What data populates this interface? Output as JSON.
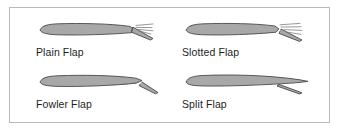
{
  "figure": {
    "border_color": "#b9b9b9",
    "background_color": "#ffffff",
    "airfoil_fill": "#a8a8a8",
    "airfoil_stroke": "#4a4a4a",
    "label_color": "#1e1e1e"
  },
  "panels": [
    {
      "id": "plain-flap",
      "label": "Plain Flap",
      "description": "Airfoil cross-section with hinged trailing edge deflected downward, airflow lines trailing aft",
      "has_slot": false,
      "has_airflow_lines": true
    },
    {
      "id": "slotted-flap",
      "label": "Slotted Flap",
      "description": "Airfoil cross-section with flap deflected downward and a slot between wing and flap, airflow lines trailing aft",
      "has_slot": true,
      "has_airflow_lines": true
    },
    {
      "id": "fowler-flap",
      "label": "Fowler Flap",
      "description": "Airfoil cross-section with flap extended rearward and downward along a track, slot visible",
      "has_slot": true,
      "has_airflow_lines": false
    },
    {
      "id": "split-flap",
      "label": "Split Flap",
      "description": "Airfoil cross-section with lower surface of trailing edge deflected downward, upper surface unchanged",
      "has_slot": false,
      "has_airflow_lines": false
    }
  ]
}
